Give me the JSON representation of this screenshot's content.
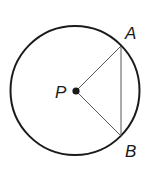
{
  "diagram": {
    "type": "geometry",
    "circle": {
      "cx": 75,
      "cy": 90.5,
      "r": 64.5,
      "stroke": "#1a1a1a"
    },
    "points": {
      "P": {
        "label": "P",
        "x": 76,
        "y": 91
      },
      "A": {
        "label": "A",
        "x": 121,
        "y": 46
      },
      "B": {
        "label": "B",
        "x": 121,
        "y": 136
      }
    },
    "segments": [
      {
        "name": "PA",
        "from": "P",
        "to": "A"
      },
      {
        "name": "PB",
        "from": "P",
        "to": "B"
      },
      {
        "name": "AB",
        "from": "A",
        "to": "B"
      }
    ],
    "labels": {
      "P": "P",
      "A": "A",
      "B": "B"
    }
  }
}
